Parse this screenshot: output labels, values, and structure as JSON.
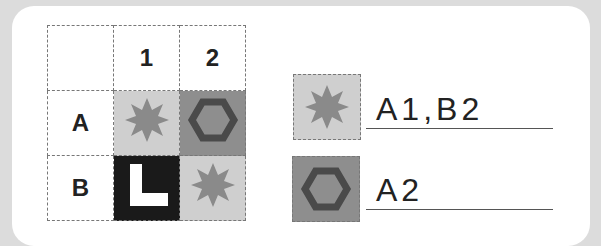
{
  "grid": {
    "col_headers": [
      "1",
      "2"
    ],
    "row_headers": [
      "A",
      "B"
    ],
    "cells": [
      [
        {
          "shape": "star-icon",
          "fill": "#cfcfcf"
        },
        {
          "shape": "hexagon-icon",
          "fill": "#8e8e8e"
        }
      ],
      [
        {
          "shape": "l-shape-icon",
          "fill": "#1a1a1a"
        },
        {
          "shape": "star-icon",
          "fill": "#cfcfcf"
        }
      ]
    ]
  },
  "legend": [
    {
      "shape": "star-icon",
      "answer": "A1,B2"
    },
    {
      "shape": "hexagon-icon",
      "answer": "A2"
    }
  ],
  "colors": {
    "star": "#8a8a8a",
    "hexagon": "#4a4a4a",
    "light_cell": "#cfcfcf",
    "dark_cell": "#8e8e8e",
    "black_cell": "#1a1a1a"
  }
}
